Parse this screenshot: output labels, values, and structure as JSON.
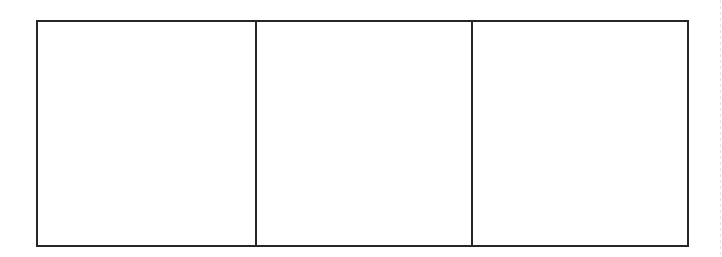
{
  "diagram": {
    "panels": [
      {
        "label": ""
      },
      {
        "label": ""
      },
      {
        "label": ""
      }
    ],
    "border_color": "#262626",
    "background_color": "#ffffff"
  }
}
